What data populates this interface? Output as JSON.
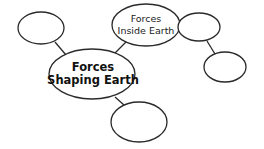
{
  "diagram": {
    "type": "concept-map",
    "nodes": {
      "central": {
        "line1": "Forces",
        "line2": "Shaping Earth"
      },
      "inside_earth": {
        "line1": "Forces",
        "line2": "Inside Earth"
      },
      "top_left_blank": {
        "text": ""
      },
      "right_top_blank": {
        "text": ""
      },
      "right_bottom_blank": {
        "text": ""
      },
      "bottom_blank": {
        "text": ""
      }
    },
    "edges": [
      {
        "from": "central",
        "to": "top_left_blank"
      },
      {
        "from": "central",
        "to": "inside_earth"
      },
      {
        "from": "central",
        "to": "bottom_blank"
      },
      {
        "from": "inside_earth",
        "to": "right_top_blank"
      },
      {
        "from": "right_top_blank",
        "to": "right_bottom_blank"
      }
    ],
    "colors": {
      "stroke": "#2a2a2a",
      "fill": "#ffffff",
      "text": "#111111"
    }
  }
}
